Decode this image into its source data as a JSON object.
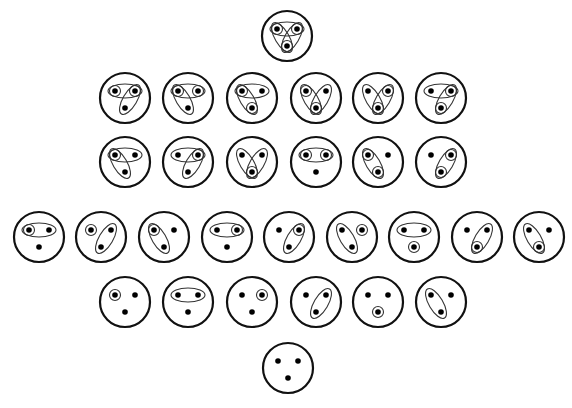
{
  "colors": {
    "stroke": "#111111",
    "dot": "#000000",
    "background": "#ffffff"
  },
  "legend": {
    "points": [
      "L",
      "R",
      "B"
    ],
    "singletons": [
      "l",
      "r",
      "b"
    ],
    "pairs": [
      "LR",
      "LB",
      "RB"
    ]
  },
  "rows": [
    {
      "row": 1,
      "diagrams": [
        [
          "l",
          "r",
          "b",
          "LR",
          "LB",
          "RB"
        ]
      ]
    },
    {
      "row": 2,
      "diagrams": [
        [
          "l",
          "r",
          "LR",
          "RB"
        ],
        [
          "l",
          "r",
          "LR",
          "LB"
        ],
        [
          "l",
          "b",
          "LR",
          "LB"
        ],
        [
          "l",
          "b",
          "LB",
          "RB"
        ],
        [
          "r",
          "b",
          "LB",
          "RB"
        ],
        [
          "r",
          "b",
          "LR",
          "RB"
        ]
      ]
    },
    {
      "row": 3,
      "diagrams": [
        [
          "l",
          "LR",
          "LB"
        ],
        [
          "r",
          "LR",
          "RB"
        ],
        [
          "b",
          "LB",
          "RB"
        ],
        [
          "l",
          "r",
          "LR"
        ],
        [
          "l",
          "b",
          "LB"
        ],
        [
          "r",
          "b",
          "RB"
        ]
      ]
    },
    {
      "row": 4,
      "diagrams": [
        [
          "l",
          "LR"
        ],
        [
          "l",
          "RB"
        ],
        [
          "l",
          "LB"
        ],
        [
          "r",
          "LR"
        ],
        [
          "r",
          "RB"
        ],
        [
          "r",
          "LB"
        ],
        [
          "b",
          "LR"
        ],
        [
          "b",
          "RB"
        ],
        [
          "b",
          "LB"
        ]
      ]
    },
    {
      "row": 5,
      "diagrams": [
        [
          "l"
        ],
        [
          "LR"
        ],
        [
          "r"
        ],
        [
          "RB"
        ],
        [
          "b"
        ],
        [
          "LB"
        ]
      ]
    },
    {
      "row": 6,
      "diagrams": [
        []
      ]
    }
  ]
}
